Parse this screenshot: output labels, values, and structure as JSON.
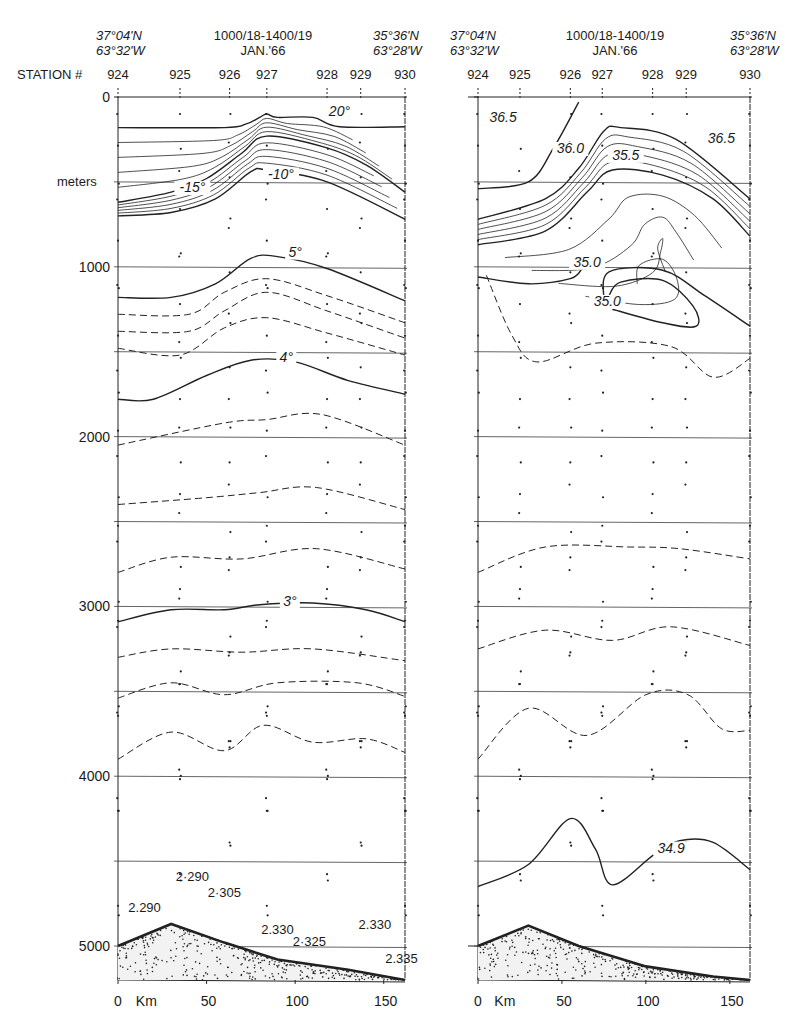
{
  "chart_data": [
    {
      "type": "heatmap",
      "title": "Temperature section (°C), stations 924–930",
      "header": {
        "start_position": [
          "37°04'N",
          "63°32'W"
        ],
        "date_range": [
          "1000/18-1400/19",
          "JAN.'66"
        ],
        "end_position": [
          "35°36'N",
          "63°28'W"
        ]
      },
      "station_label": "STATION #",
      "stations": [
        "924",
        "925",
        "926",
        "927",
        "928",
        "929",
        "930"
      ],
      "station_km": [
        0,
        35,
        63,
        84,
        118,
        137,
        162
      ],
      "xlabel": "Km",
      "x_ticks": [
        0,
        50,
        100,
        150
      ],
      "xlim": [
        0,
        162
      ],
      "ylabel": "meters",
      "y_ticks": [
        0,
        1000,
        2000,
        3000,
        4000,
        5000
      ],
      "ylim": [
        0,
        5200
      ],
      "grid_y_every_m": 500,
      "contour_labels": [
        {
          "text": "20°",
          "km": 125,
          "m": 110
        },
        {
          "text": "-10°",
          "km": 92,
          "m": 480
        },
        {
          "text": "-15°",
          "km": 42,
          "m": 560
        },
        {
          "text": "5°",
          "km": 100,
          "m": 940
        },
        {
          "text": "4°",
          "km": 95,
          "m": 1560
        },
        {
          "text": "3°",
          "km": 97,
          "m": 3000
        }
      ],
      "bottom_annotations": [
        {
          "text": "2·290",
          "km": 42,
          "m": 4620
        },
        {
          "text": "2.290",
          "km": 15,
          "m": 4800
        },
        {
          "text": "2·305",
          "km": 60,
          "m": 4710
        },
        {
          "text": "2.330",
          "km": 90,
          "m": 4930
        },
        {
          "text": "2·325",
          "km": 108,
          "m": 5000
        },
        {
          "text": "2.330",
          "km": 145,
          "m": 4900
        },
        {
          "text": "2.335",
          "km": 160,
          "m": 5100
        }
      ],
      "isotherms_solid": [
        {
          "value": "20",
          "points": [
            [
              0,
              180
            ],
            [
              60,
              180
            ],
            [
              72,
              160
            ],
            [
              80,
              120
            ],
            [
              84,
              100
            ],
            [
              90,
              120
            ],
            [
              110,
              120
            ],
            [
              125,
              175
            ],
            [
              162,
              175
            ]
          ]
        },
        {
          "value": "15",
          "points": [
            [
              0,
              620
            ],
            [
              30,
              560
            ],
            [
              50,
              480
            ],
            [
              70,
              330
            ],
            [
              84,
              230
            ],
            [
              118,
              300
            ],
            [
              140,
              400
            ],
            [
              162,
              560
            ]
          ]
        },
        {
          "value": "10",
          "points": [
            [
              0,
              700
            ],
            [
              30,
              680
            ],
            [
              55,
              600
            ],
            [
              75,
              440
            ],
            [
              84,
              430
            ],
            [
              118,
              500
            ],
            [
              162,
              720
            ]
          ]
        },
        {
          "value": "5",
          "points": [
            [
              0,
              1180
            ],
            [
              30,
              1180
            ],
            [
              55,
              1100
            ],
            [
              75,
              950
            ],
            [
              90,
              940
            ],
            [
              118,
              1010
            ],
            [
              162,
              1200
            ]
          ]
        },
        {
          "value": "4",
          "points": [
            [
              0,
              1780
            ],
            [
              20,
              1780
            ],
            [
              50,
              1640
            ],
            [
              75,
              1550
            ],
            [
              100,
              1560
            ],
            [
              130,
              1670
            ],
            [
              162,
              1750
            ]
          ]
        },
        {
          "value": "3",
          "points": [
            [
              0,
              3090
            ],
            [
              30,
              3020
            ],
            [
              60,
              3020
            ],
            [
              80,
              2990
            ],
            [
              110,
              2980
            ],
            [
              140,
              3020
            ],
            [
              162,
              3090
            ]
          ]
        }
      ],
      "isotherms_dashed_m": [
        [
          [
            0,
            1280
          ],
          [
            40,
            1280
          ],
          [
            60,
            1150
          ],
          [
            84,
            1070
          ],
          [
            118,
            1170
          ],
          [
            162,
            1330
          ]
        ],
        [
          [
            0,
            1380
          ],
          [
            40,
            1380
          ],
          [
            60,
            1260
          ],
          [
            84,
            1150
          ],
          [
            118,
            1260
          ],
          [
            162,
            1420
          ]
        ],
        [
          [
            0,
            1480
          ],
          [
            35,
            1520
          ],
          [
            60,
            1360
          ],
          [
            84,
            1300
          ],
          [
            118,
            1390
          ],
          [
            162,
            1520
          ]
        ],
        [
          [
            0,
            2050
          ],
          [
            60,
            1920
          ],
          [
            84,
            1900
          ],
          [
            115,
            1870
          ],
          [
            162,
            2050
          ]
        ],
        [
          [
            0,
            2400
          ],
          [
            50,
            2360
          ],
          [
            80,
            2330
          ],
          [
            112,
            2300
          ],
          [
            162,
            2430
          ]
        ],
        [
          [
            0,
            2800
          ],
          [
            30,
            2710
          ],
          [
            70,
            2720
          ],
          [
            112,
            2660
          ],
          [
            162,
            2780
          ]
        ],
        [
          [
            0,
            3300
          ],
          [
            30,
            3250
          ],
          [
            70,
            3270
          ],
          [
            110,
            3250
          ],
          [
            162,
            3320
          ]
        ],
        [
          [
            0,
            3540
          ],
          [
            30,
            3450
          ],
          [
            60,
            3520
          ],
          [
            90,
            3450
          ],
          [
            135,
            3450
          ],
          [
            162,
            3530
          ]
        ],
        [
          [
            0,
            3900
          ],
          [
            30,
            3740
          ],
          [
            60,
            3850
          ],
          [
            82,
            3700
          ],
          [
            110,
            3800
          ],
          [
            140,
            3780
          ],
          [
            162,
            3860
          ]
        ]
      ],
      "bottom_profile_m": [
        [
          0,
          5000
        ],
        [
          30,
          4870
        ],
        [
          60,
          4980
        ],
        [
          90,
          5080
        ],
        [
          130,
          5140
        ],
        [
          162,
          5200
        ]
      ]
    },
    {
      "type": "heatmap",
      "title": "Salinity section (‰), stations 924–930",
      "header": {
        "start_position": [
          "37°04'N",
          "63°32'W"
        ],
        "date_range": [
          "1000/18-1400/19",
          "JAN.'66"
        ],
        "end_position": [
          "35°36'N",
          "63°28'W"
        ]
      },
      "stations": [
        "924",
        "925",
        "926",
        "927",
        "928",
        "929",
        "930"
      ],
      "station_km": [
        0,
        25,
        55,
        74,
        104,
        124,
        162
      ],
      "xlabel": "Km",
      "x_ticks": [
        0,
        50,
        100,
        150
      ],
      "xlim": [
        0,
        162
      ],
      "ylim": [
        0,
        5200
      ],
      "contour_labels": [
        {
          "text": "36.5",
          "km": 15,
          "m": 150
        },
        {
          "text": "36.0",
          "km": 55,
          "m": 330
        },
        {
          "text": "35.5",
          "km": 88,
          "m": 370
        },
        {
          "text": "36.5",
          "km": 145,
          "m": 270
        },
        {
          "text": "35.0",
          "km": 65,
          "m": 1000
        },
        {
          "text": "35.0",
          "km": 77,
          "m": 1230
        },
        {
          "text": "34.9",
          "km": 115,
          "m": 4450
        }
      ],
      "isohalines_solid": [
        {
          "value": "36.5",
          "points": [
            [
              0,
              540
            ],
            [
              30,
              500
            ],
            [
              45,
              300
            ],
            [
              60,
              30
            ]
          ]
        },
        {
          "value": "36.0",
          "points": [
            [
              0,
              720
            ],
            [
              40,
              600
            ],
            [
              60,
              420
            ],
            [
              75,
              200
            ],
            [
              85,
              180
            ],
            [
              118,
              250
            ],
            [
              162,
              600
            ]
          ]
        },
        {
          "value": "35.5",
          "points": [
            [
              0,
              870
            ],
            [
              40,
              790
            ],
            [
              65,
              560
            ],
            [
              80,
              430
            ],
            [
              110,
              460
            ],
            [
              140,
              600
            ],
            [
              162,
              820
            ]
          ]
        },
        {
          "value": "35.0",
          "points": [
            [
              0,
              1060
            ],
            [
              30,
              1100
            ],
            [
              55,
              1070
            ],
            [
              62,
              1010
            ]
          ]
        },
        {
          "value": "35.0",
          "points": [
            [
              75,
              1200
            ],
            [
              78,
              1030
            ],
            [
              110,
              1020
            ],
            [
              135,
              1170
            ],
            [
              162,
              1350
            ]
          ]
        },
        {
          "value": "35.0",
          "points": [
            [
              80,
              1250
            ],
            [
              110,
              1330
            ],
            [
              130,
              1350
            ],
            [
              128,
              1230
            ],
            [
              110,
              1080
            ],
            [
              85,
              1090
            ],
            [
              78,
              1170
            ]
          ]
        },
        {
          "value": "34.9",
          "points": [
            [
              0,
              4650
            ],
            [
              30,
              4520
            ],
            [
              55,
              4250
            ],
            [
              70,
              4430
            ],
            [
              80,
              4640
            ],
            [
              105,
              4460
            ],
            [
              120,
              4380
            ],
            [
              140,
              4390
            ],
            [
              162,
              4550
            ]
          ]
        }
      ],
      "isohalines_dashed_m": [
        [
          [
            5,
            1050
          ],
          [
            20,
            1400
          ],
          [
            35,
            1560
          ],
          [
            70,
            1450
          ],
          [
            115,
            1470
          ],
          [
            140,
            1650
          ],
          [
            162,
            1540
          ]
        ],
        [
          [
            0,
            2800
          ],
          [
            40,
            2650
          ],
          [
            90,
            2650
          ],
          [
            120,
            2660
          ],
          [
            162,
            2720
          ]
        ],
        [
          [
            0,
            3250
          ],
          [
            40,
            3140
          ],
          [
            80,
            3200
          ],
          [
            115,
            3120
          ],
          [
            162,
            3230
          ]
        ],
        [
          [
            0,
            3900
          ],
          [
            30,
            3600
          ],
          [
            65,
            3760
          ],
          [
            100,
            3520
          ],
          [
            125,
            3520
          ],
          [
            145,
            3720
          ],
          [
            162,
            3730
          ]
        ]
      ],
      "bottom_profile_m": [
        [
          0,
          5000
        ],
        [
          30,
          4880
        ],
        [
          60,
          5000
        ],
        [
          100,
          5120
        ],
        [
          140,
          5180
        ],
        [
          162,
          5200
        ]
      ]
    }
  ],
  "figure": {
    "panels": {
      "left": {
        "x0": 118,
        "x1": 405,
        "y0": 97,
        "y1": 985
      },
      "right": {
        "x0": 478,
        "x1": 750,
        "y0": 97,
        "y1": 985
      }
    },
    "px_per_m": 0.1698,
    "line_color": "#222222",
    "background": "#ffffff"
  }
}
